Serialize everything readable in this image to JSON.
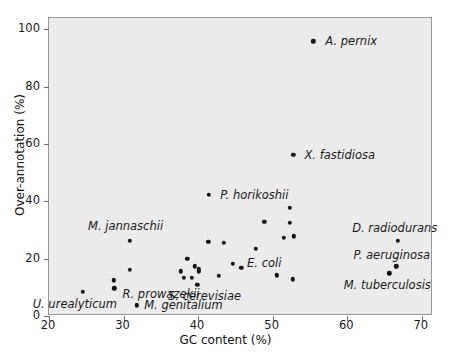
{
  "chart_data": {
    "type": "scatter",
    "title": "",
    "xlabel": "GC content (%)",
    "ylabel": "Over-annotation (%)",
    "xlim": [
      20,
      71.5
    ],
    "ylim": [
      0,
      104
    ],
    "xticks": [
      20,
      30,
      40,
      50,
      60,
      70
    ],
    "yticks": [
      0,
      20,
      40,
      60,
      80,
      100
    ],
    "xtick_labels": [
      "20",
      "30",
      "40",
      "50",
      "60",
      "70"
    ],
    "ytick_labels": [
      "0",
      "20",
      "40",
      "60",
      "80",
      "100"
    ],
    "grid": false,
    "legend": "none",
    "plot_background": "#ebebeb",
    "marker_color": "#141414",
    "points": [
      {
        "x": 55.6,
        "y": 95.5,
        "label": "A. pernix",
        "lx": 57.2,
        "ly": 95.5,
        "anchor": "left"
      },
      {
        "x": 52.9,
        "y": 56.0,
        "label": "X. fastidiosa",
        "lx": 54.4,
        "ly": 56.0,
        "anchor": "left"
      },
      {
        "x": 41.6,
        "y": 42.0,
        "label": "P. horikoshii",
        "lx": 43.1,
        "ly": 42.0,
        "anchor": "left"
      },
      {
        "x": 52.4,
        "y": 37.5,
        "label": "",
        "lx": 0,
        "ly": 0,
        "anchor": "left"
      },
      {
        "x": 49.0,
        "y": 32.5,
        "label": "",
        "lx": 0,
        "ly": 0,
        "anchor": "left"
      },
      {
        "x": 52.4,
        "y": 32.2,
        "label": "",
        "lx": 0,
        "ly": 0,
        "anchor": "left"
      },
      {
        "x": 51.6,
        "y": 27.0,
        "label": "",
        "lx": 0,
        "ly": 0,
        "anchor": "left"
      },
      {
        "x": 53.0,
        "y": 27.5,
        "label": "",
        "lx": 0,
        "ly": 0,
        "anchor": "left"
      },
      {
        "x": 31.0,
        "y": 26.0,
        "label": "M. jannaschii",
        "lx": 30.4,
        "ly": 31.0,
        "anchor": "center"
      },
      {
        "x": 66.9,
        "y": 26.0,
        "label": "D. radiodurans",
        "lx": 66.5,
        "ly": 30.5,
        "anchor": "center"
      },
      {
        "x": 41.5,
        "y": 25.5,
        "label": "",
        "lx": 0,
        "ly": 0,
        "anchor": "left"
      },
      {
        "x": 43.6,
        "y": 25.3,
        "label": "",
        "lx": 0,
        "ly": 0,
        "anchor": "left"
      },
      {
        "x": 47.9,
        "y": 23.2,
        "label": "",
        "lx": 0,
        "ly": 0,
        "anchor": "left"
      },
      {
        "x": 38.7,
        "y": 19.7,
        "label": "",
        "lx": 0,
        "ly": 0,
        "anchor": "left"
      },
      {
        "x": 44.8,
        "y": 17.8,
        "label": "",
        "lx": 0,
        "ly": 0,
        "anchor": "left"
      },
      {
        "x": 66.7,
        "y": 17.0,
        "label": "P. aeruginosa",
        "lx": 66.1,
        "ly": 21.0,
        "anchor": "center"
      },
      {
        "x": 39.7,
        "y": 17.0,
        "label": "",
        "lx": 0,
        "ly": 0,
        "anchor": "left"
      },
      {
        "x": 45.9,
        "y": 16.5,
        "label": "",
        "lx": 0,
        "ly": 0,
        "anchor": "left"
      },
      {
        "x": 40.2,
        "y": 15.9,
        "label": "",
        "lx": 0,
        "ly": 0,
        "anchor": "left"
      },
      {
        "x": 40.2,
        "y": 15.2,
        "label": "",
        "lx": 0,
        "ly": 0,
        "anchor": "left"
      },
      {
        "x": 31.0,
        "y": 15.8,
        "label": "",
        "lx": 0,
        "ly": 0,
        "anchor": "left"
      },
      {
        "x": 37.8,
        "y": 15.3,
        "label": "",
        "lx": 0,
        "ly": 0,
        "anchor": "left"
      },
      {
        "x": 65.8,
        "y": 14.5,
        "label": "M. tuberculosis",
        "lx": 65.5,
        "ly": 10.5,
        "anchor": "center"
      },
      {
        "x": 50.7,
        "y": 13.8,
        "label": "E. coli",
        "lx": 49.0,
        "ly": 18.0,
        "anchor": "center"
      },
      {
        "x": 42.9,
        "y": 13.7,
        "label": "",
        "lx": 0,
        "ly": 0,
        "anchor": "left"
      },
      {
        "x": 38.2,
        "y": 13.0,
        "label": "",
        "lx": 0,
        "ly": 0,
        "anchor": "left"
      },
      {
        "x": 39.3,
        "y": 13.0,
        "label": "",
        "lx": 0,
        "ly": 0,
        "anchor": "left"
      },
      {
        "x": 52.8,
        "y": 12.4,
        "label": "",
        "lx": 0,
        "ly": 0,
        "anchor": "left"
      },
      {
        "x": 28.8,
        "y": 12.1,
        "label": "",
        "lx": 0,
        "ly": 0,
        "anchor": "left"
      },
      {
        "x": 40.0,
        "y": 10.6,
        "label": "S. cerevisiae",
        "lx": 41.0,
        "ly": 6.6,
        "anchor": "center"
      },
      {
        "x": 28.9,
        "y": 9.3,
        "label": "R. prowazekii",
        "lx": 30.0,
        "ly": 7.2,
        "anchor": "left"
      },
      {
        "x": 24.7,
        "y": 8.2,
        "label": "U. urealyticum",
        "lx": 23.6,
        "ly": 4.0,
        "anchor": "center"
      },
      {
        "x": 31.9,
        "y": 3.4,
        "label": "M. genitalium",
        "lx": 32.9,
        "ly": 3.4,
        "anchor": "left"
      }
    ]
  }
}
